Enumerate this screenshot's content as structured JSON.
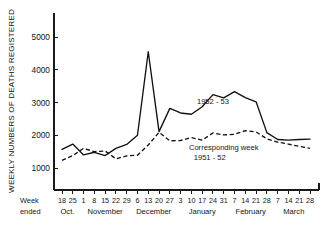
{
  "chart_data": {
    "type": "line",
    "title": "",
    "xlabel": "Week ended",
    "ylabel": "WEEKLY NUMBERS OF DEATHS REGISTERED",
    "ylim": [
      600,
      5600
    ],
    "yticks": [
      1000,
      2000,
      3000,
      4000,
      5000
    ],
    "grid": false,
    "legend_position": "inline-annotations",
    "x_corner_label_line1": "Week",
    "x_corner_label_line2": "ended",
    "categories": [
      "18",
      "25",
      "1",
      "8",
      "15",
      "22",
      "29",
      "6",
      "13",
      "20",
      "27",
      "3",
      "10",
      "17",
      "24",
      "31",
      "7",
      "14",
      "21",
      "28",
      "7",
      "14",
      "21",
      "28"
    ],
    "month_groups": [
      {
        "label": "Oct.",
        "start_index": 0,
        "end_index": 1
      },
      {
        "label": "November",
        "start_index": 2,
        "end_index": 6
      },
      {
        "label": "December",
        "start_index": 7,
        "end_index": 10
      },
      {
        "label": "January",
        "start_index": 11,
        "end_index": 15
      },
      {
        "label": "February",
        "start_index": 16,
        "end_index": 19
      },
      {
        "label": "March",
        "start_index": 20,
        "end_index": 23
      }
    ],
    "series": [
      {
        "name": "1952 - 53",
        "style": "solid",
        "annotation": "1952 - 53",
        "annotation_x_index": 14.0,
        "annotation_value": 2950,
        "values": [
          1570,
          1730,
          1400,
          1480,
          1380,
          1600,
          1720,
          2000,
          4550,
          2110,
          2820,
          2680,
          2640,
          2870,
          3240,
          3140,
          3330,
          3150,
          3020,
          2080,
          1870,
          1850,
          1870,
          1880
        ]
      },
      {
        "name": "Corresponding week 1951 - 52",
        "style": "dashed",
        "annotation_line1": "Corresponding week",
        "annotation_line2": "1951 - 52",
        "annotation_x_index": 15.0,
        "annotation_value": 1560,
        "values": [
          1230,
          1380,
          1600,
          1500,
          1520,
          1280,
          1370,
          1390,
          1700,
          2090,
          1830,
          1840,
          1930,
          1850,
          2070,
          2010,
          2030,
          2140,
          2100,
          1890,
          1790,
          1730,
          1660,
          1600
        ]
      }
    ]
  }
}
